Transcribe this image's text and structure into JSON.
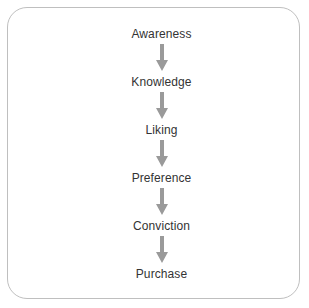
{
  "diagram": {
    "type": "vertical-flow-chart",
    "title": "",
    "orientation": "top-to-bottom",
    "colors": {
      "background": "#ffffff",
      "border": "#bfbfbf",
      "label_text": "#333333",
      "arrow": "#9a9a9a"
    },
    "steps": [
      {
        "label": "Awareness"
      },
      {
        "label": "Knowledge"
      },
      {
        "label": "Liking"
      },
      {
        "label": "Preference"
      },
      {
        "label": "Conviction"
      },
      {
        "label": "Purchase"
      }
    ],
    "connectors": [
      {
        "glyph": "down-arrow",
        "from": "Awareness",
        "to": "Knowledge"
      },
      {
        "glyph": "down-arrow",
        "from": "Knowledge",
        "to": "Liking"
      },
      {
        "glyph": "down-arrow",
        "from": "Liking",
        "to": "Preference"
      },
      {
        "glyph": "down-arrow",
        "from": "Preference",
        "to": "Conviction"
      },
      {
        "glyph": "down-arrow",
        "from": "Conviction",
        "to": "Purchase"
      }
    ]
  }
}
